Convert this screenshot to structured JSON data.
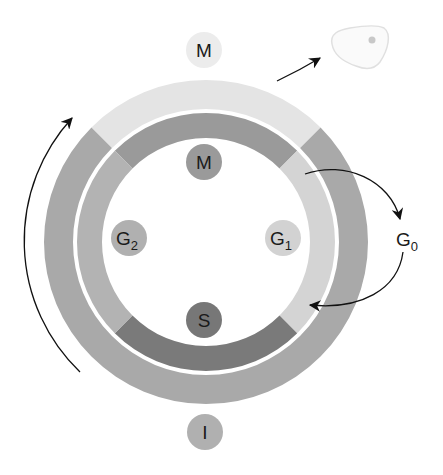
{
  "diagram": {
    "type": "cell-cycle",
    "center": [
      206,
      242
    ],
    "outer_ring": {
      "r_inner": 133,
      "r_outer": 162,
      "segments": [
        {
          "name": "mitosis",
          "label": "M",
          "start_deg": -45,
          "end_deg": 45,
          "color": "#e4e4e4"
        },
        {
          "name": "interphase",
          "label": "I",
          "start_deg": 45,
          "end_deg": 315,
          "color": "#a9a9a9"
        }
      ]
    },
    "inner_ring": {
      "r_inner": 104,
      "r_outer": 129,
      "segments": [
        {
          "name": "M-phase",
          "label": "M",
          "start_deg": -45,
          "end_deg": 45,
          "color": "#9a9a9a"
        },
        {
          "name": "G1-phase",
          "label": "G1",
          "start_deg": 45,
          "end_deg": 135,
          "color": "#d4d4d4"
        },
        {
          "name": "S-phase",
          "label": "S",
          "start_deg": 135,
          "end_deg": 225,
          "color": "#7a7a7a"
        },
        {
          "name": "G2-phase",
          "label": "G2",
          "start_deg": 225,
          "end_deg": 315,
          "color": "#b3b3b3"
        }
      ]
    },
    "nodes": {
      "outer_m": {
        "text": "M",
        "cx": 204,
        "cy": 50,
        "r": 18,
        "color": "#ececec"
      },
      "inner_m": {
        "text": "M",
        "cx": 204,
        "cy": 162,
        "r": 18,
        "color": "#9a9a9a"
      },
      "g1": {
        "text": "G",
        "sub": "1",
        "cx": 283,
        "cy": 238,
        "r": 18,
        "color": "#d2d2d2"
      },
      "g2": {
        "text": "G",
        "sub": "2",
        "cx": 129,
        "cy": 238,
        "r": 18,
        "color": "#b0b0b0"
      },
      "s": {
        "text": "S",
        "cx": 204,
        "cy": 320,
        "r": 18,
        "color": "#777777"
      },
      "i": {
        "text": "I",
        "cx": 205,
        "cy": 432,
        "r": 18,
        "color": "#b0b0b0"
      }
    },
    "g0": {
      "text": "G",
      "sub": "0"
    },
    "arrows": [
      {
        "name": "cycle-direction-arrow",
        "description": "arc on left side pointing upward (clockwise progression)"
      },
      {
        "name": "exit-to-cell-arrow",
        "description": "arrow from top-right of ring to daughter cell"
      },
      {
        "name": "g1-to-g0-arrow",
        "description": "arrow from G1 out to G0"
      },
      {
        "name": "g0-to-g1-arrow",
        "description": "arrow from G0 back into G1"
      }
    ],
    "cell": {
      "fill": "#fafafa",
      "outline": "#e2e2e2",
      "nucleus_color": "#c8c8c8"
    }
  }
}
